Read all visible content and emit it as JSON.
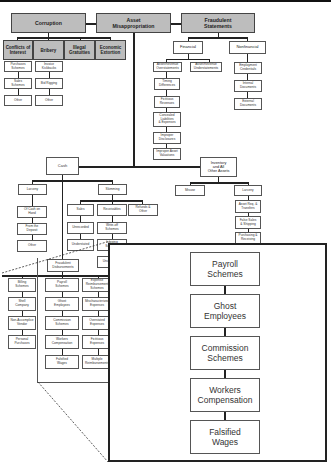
{
  "diagram": {
    "top_categories": [
      {
        "label": "Corruption"
      },
      {
        "label": "Asset\nMisappropriation"
      },
      {
        "label": "Fraudulent\nStatements"
      }
    ],
    "corruption": {
      "children": [
        {
          "label": "Conflicts of\nInterest"
        },
        {
          "label": "Bribery"
        },
        {
          "label": "Illegal\nGratuities"
        },
        {
          "label": "Economic\nExtortion"
        }
      ],
      "conflicts_of_interest": [
        {
          "label": "Purchases\nSchemes"
        },
        {
          "label": "Sales\nSchemes"
        },
        {
          "label": "Other"
        }
      ],
      "bribery": [
        {
          "label": "Invoice\nKickbacks"
        },
        {
          "label": "Bid Rigging"
        },
        {
          "label": "Other"
        }
      ]
    },
    "fraudulent_statements": {
      "children": [
        {
          "label": "Financial"
        },
        {
          "label": "Nonfinancial"
        }
      ],
      "financial": [
        {
          "label": "Asset/Revenue\nOverstatements"
        },
        {
          "label": "Asset/Revenue\nUnderstatements"
        }
      ],
      "overstatements": [
        {
          "label": "Timing\nDifferences"
        },
        {
          "label": "Fictitious\nRevenues"
        },
        {
          "label": "Concealed\nLiabilities\n& Expenses"
        },
        {
          "label": "Improper\nDisclosures"
        },
        {
          "label": "Improper Asset\nValuations"
        }
      ],
      "nonfinancial": [
        {
          "label": "Employment\nCredentials"
        },
        {
          "label": "Internal\nDocuments"
        },
        {
          "label": "External\nDocuments"
        }
      ]
    },
    "asset_misappropriation": {
      "children": [
        {
          "label": "Cash"
        },
        {
          "label": "Inventory\nand All\nOther Assets"
        }
      ],
      "cash": {
        "children": [
          {
            "label": "Larceny"
          },
          {
            "label": "Skimming"
          },
          {
            "label": "Fraudulent\nDisbursements"
          }
        ],
        "larceny": [
          {
            "label": "Of Cash on\nHand"
          },
          {
            "label": "From the\nDeposit"
          },
          {
            "label": "Other"
          }
        ],
        "skimming": [
          {
            "label": "Sales"
          },
          {
            "label": "Receivables"
          },
          {
            "label": "Refunds &\nOther"
          }
        ],
        "sales": [
          {
            "label": "Unrecorded"
          },
          {
            "label": "Understated"
          }
        ],
        "receivables": [
          {
            "label": "Write-off\nSchemes"
          },
          {
            "label": "Lapping\nSchemes"
          },
          {
            "label": "Unconcealed"
          }
        ],
        "disbursements": [
          {
            "label": "Billing\nSchemes"
          },
          {
            "label": "Payroll\nSchemes"
          },
          {
            "label": "Expense\nReimbursement\nSchemes"
          }
        ],
        "billing": [
          {
            "label": "Shell\nCompany"
          },
          {
            "label": "Non-Accomplice\nVendor"
          },
          {
            "label": "Personal\nPurchases"
          }
        ],
        "payroll": [
          {
            "label": "Ghost\nEmployees"
          },
          {
            "label": "Commission\nSchemes"
          },
          {
            "label": "Workers\nCompensation"
          },
          {
            "label": "Falsified\nWages"
          }
        ],
        "expense": [
          {
            "label": "Mischaracterized\nExpenses"
          },
          {
            "label": "Overstated\nExpenses"
          },
          {
            "label": "Fictitious\nExpenses"
          },
          {
            "label": "Multiple\nReimbursements"
          }
        ]
      },
      "inventory": {
        "children": [
          {
            "label": "Misuse"
          },
          {
            "label": "Larceny"
          }
        ],
        "larceny": [
          {
            "label": "Asset Req. &\nTransfers"
          },
          {
            "label": "False Sales\n& Shipping"
          },
          {
            "label": "Purchasing &\nReceiving"
          }
        ]
      }
    },
    "magnified_callout": {
      "items": [
        {
          "label": "Payroll\nSchemes"
        },
        {
          "label": "Ghost\nEmployees"
        },
        {
          "label": "Commission\nSchemes"
        },
        {
          "label": "Workers\nCompensation"
        },
        {
          "label": "Falsified\nWages"
        }
      ]
    }
  }
}
